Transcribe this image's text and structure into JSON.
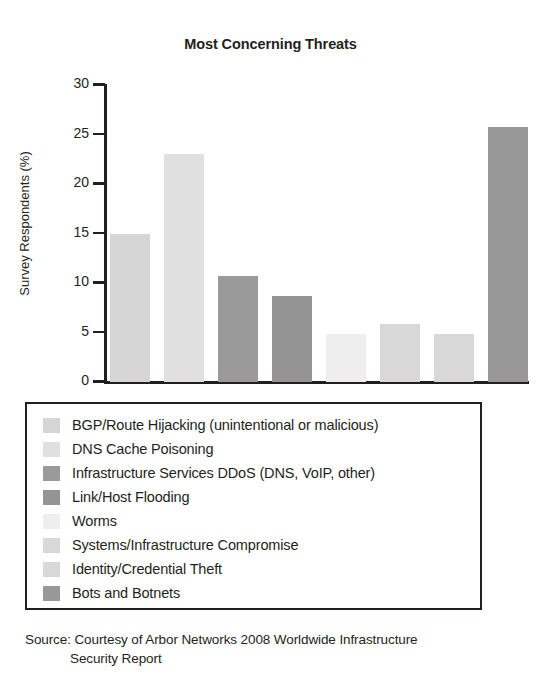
{
  "chart_data": {
    "type": "bar",
    "title": "Most Concerning Threats",
    "xlabel": "",
    "ylabel": "Survey Respondents (%)",
    "ylim": [
      0,
      30
    ],
    "yticks": [
      0,
      5,
      10,
      15,
      20,
      25,
      30
    ],
    "ytick_labels": [
      "0",
      "5",
      "10",
      "15",
      "20",
      "25",
      "30"
    ],
    "grid": false,
    "legend_position": "below-plot",
    "categories": [
      "BGP/Route Hijacking (unintentional or malicious)",
      "DNS Cache Poisoning",
      "Infrastructure Services DDoS (DNS, VoIP, other)",
      "Link/Host Flooding",
      "Worms",
      "Systems/Infrastructure Compromise",
      "Identity/Credential Theft",
      "Bots and Botnets"
    ],
    "values": [
      15.0,
      23.0,
      10.7,
      8.7,
      4.8,
      5.9,
      4.9,
      25.8
    ],
    "colors": [
      "#d5d5d5",
      "#e0e0e0",
      "#9a9a9a",
      "#949494",
      "#eeeeee",
      "#d8d8d8",
      "#d8d8d8",
      "#989898"
    ]
  },
  "legend": {
    "items": [
      {
        "label": "BGP/Route Hijacking (unintentional or malicious)",
        "color": "#d5d5d5"
      },
      {
        "label": "DNS Cache Poisoning",
        "color": "#e0e0e0"
      },
      {
        "label": "Infrastructure Services DDoS (DNS, VoIP, other)",
        "color": "#9a9a9a"
      },
      {
        "label": "Link/Host Flooding",
        "color": "#949494"
      },
      {
        "label": "Worms",
        "color": "#eeeeee"
      },
      {
        "label": "Systems/Infrastructure Compromise",
        "color": "#d8d8d8"
      },
      {
        "label": "Identity/Credential Theft",
        "color": "#d8d8d8"
      },
      {
        "label": "Bots and Botnets",
        "color": "#989898"
      }
    ]
  },
  "source": {
    "line1": "Source: Courtesy of  Arbor Networks 2008 Worldwide Infrastructure",
    "line2": "Security Report"
  }
}
